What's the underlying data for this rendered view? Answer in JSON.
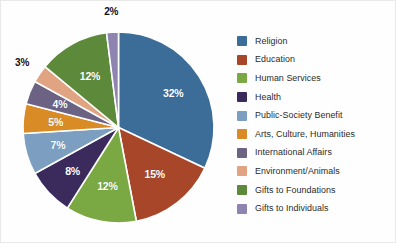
{
  "chart_data": {
    "type": "pie",
    "title": "",
    "subtitle": "",
    "xlabel": "",
    "ylabel": "",
    "legend_position": "right",
    "grid": false,
    "categories": [
      "Religion",
      "Education",
      "Human Services",
      "Health",
      "Public-Society Benefit",
      "Arts, Culture, Humanities",
      "International Affairs",
      "Environment/Animals",
      "Gifts to Foundations",
      "Gifts to Individuals"
    ],
    "values": [
      32,
      15,
      12,
      8,
      7,
      5,
      4,
      3,
      12,
      2
    ],
    "value_labels": [
      "32%",
      "15%",
      "12%",
      "8%",
      "7%",
      "5%",
      "4%",
      "3%",
      "12%",
      "2%"
    ],
    "colors": [
      "#3c6d99",
      "#a8462a",
      "#7aa943",
      "#3b2b5c",
      "#7b9ec1",
      "#d98c26",
      "#6b6284",
      "#e0a482",
      "#5d8a3a",
      "#8d84af"
    ],
    "label_colors": [
      "#ffffff",
      "#ffffff",
      "#ffffff",
      "#ffffff",
      "#ffffff",
      "#ffffff",
      "#ffffff",
      "#111111",
      "#ffffff",
      "#111111"
    ],
    "label_placement": [
      "inside",
      "inside",
      "inside",
      "inside",
      "inside",
      "inside",
      "inside",
      "outside",
      "inside",
      "outside"
    ],
    "start_angle_deg": 0,
    "direction": "clockwise",
    "units": "percent"
  },
  "legend": {
    "items": [
      {
        "label": "Religion",
        "color": "#3c6d99"
      },
      {
        "label": "Education",
        "color": "#a8462a"
      },
      {
        "label": "Human Services",
        "color": "#7aa943"
      },
      {
        "label": "Health",
        "color": "#3b2b5c"
      },
      {
        "label": "Public-Society Benefit",
        "color": "#7b9ec1"
      },
      {
        "label": "Arts, Culture, Humanities",
        "color": "#d98c26"
      },
      {
        "label": "International Affairs",
        "color": "#6b6284"
      },
      {
        "label": "Environment/Animals",
        "color": "#e0a482"
      },
      {
        "label": "Gifts to Foundations",
        "color": "#5d8a3a"
      },
      {
        "label": "Gifts to Individuals",
        "color": "#8d84af"
      }
    ]
  }
}
